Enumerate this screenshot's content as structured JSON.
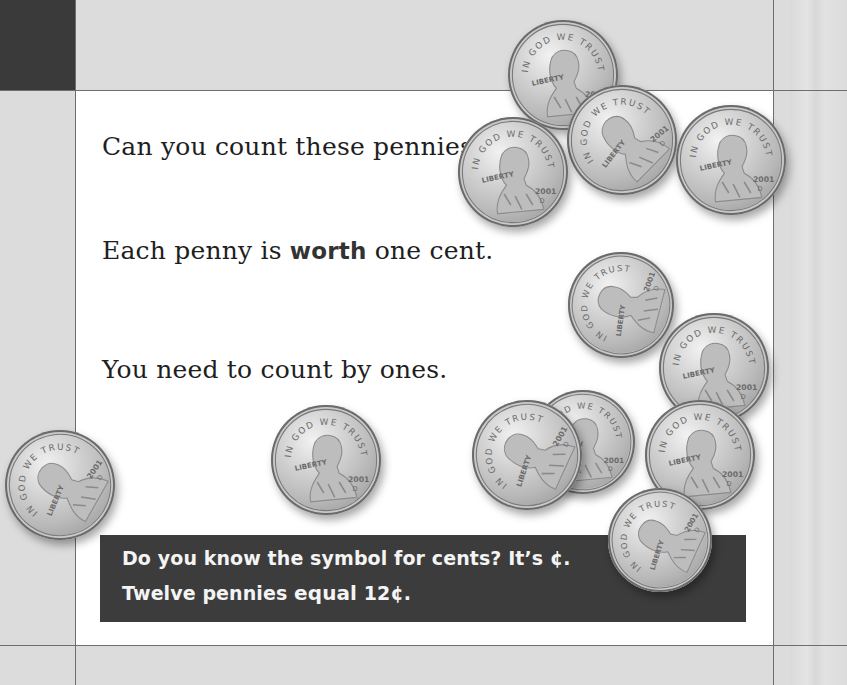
{
  "page": {
    "lines": [
      {
        "text": "Can you count these pennies?"
      },
      {
        "before": "Each penny is ",
        "bold": "worth",
        "after": " one cent."
      },
      {
        "text": "You need to count by ones."
      }
    ],
    "caption": {
      "line1": "Do you know the symbol for cents? It’s ¢.",
      "line2_before": "Twelve pennies ",
      "line2_bold": "equal",
      "line2_after": " 12¢."
    }
  },
  "illustration": {
    "coin_type": "penny",
    "coin_count": 12,
    "coin_inscriptions": {
      "top": "IN GOD WE TRUST",
      "left": "LIBERTY",
      "year": "2001",
      "mint": "D"
    },
    "coins": [
      {
        "x": 563,
        "y": 75,
        "r": 55,
        "rot": 0
      },
      {
        "x": 622,
        "y": 140,
        "r": 55,
        "rot": -40
      },
      {
        "x": 513,
        "y": 172,
        "r": 55,
        "rot": 0
      },
      {
        "x": 731,
        "y": 160,
        "r": 55,
        "rot": 0
      },
      {
        "x": 621,
        "y": 305,
        "r": 53,
        "rot": -70
      },
      {
        "x": 714,
        "y": 368,
        "r": 55,
        "rot": 0
      },
      {
        "x": 583,
        "y": 442,
        "r": 52,
        "rot": 0
      },
      {
        "x": 527,
        "y": 455,
        "r": 55,
        "rot": -60
      },
      {
        "x": 700,
        "y": 455,
        "r": 55,
        "rot": 0
      },
      {
        "x": 326,
        "y": 460,
        "r": 55,
        "rot": 0
      },
      {
        "x": 60,
        "y": 485,
        "r": 55,
        "rot": -55
      },
      {
        "x": 660,
        "y": 540,
        "r": 52,
        "rot": -60
      }
    ]
  },
  "colors": {
    "page_background": "#dcdcdc",
    "panel": "#ffffff",
    "corner_block": "#3a3a3a",
    "caption_background": "#3c3c3c",
    "caption_text": "#f4f4f4",
    "body_text": "#1e1e1e"
  }
}
